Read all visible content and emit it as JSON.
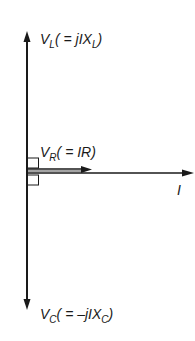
{
  "diagram": {
    "type": "phasor-diagram",
    "phasors": [
      {
        "id": "VL",
        "symbol": "V",
        "subscript": "L",
        "expr_prefix": "( = jIX",
        "expr_sub": "L",
        "expr_suffix": ")",
        "direction": "up"
      },
      {
        "id": "VR",
        "symbol": "V",
        "subscript": "R",
        "expr_prefix": "( = IR)",
        "expr_sub": "",
        "expr_suffix": "",
        "direction": "right"
      },
      {
        "id": "I",
        "symbol": "I",
        "subscript": "",
        "direction": "right"
      },
      {
        "id": "VC",
        "symbol": "V",
        "subscript": "C",
        "expr_prefix": "( = –jIX",
        "expr_sub": "C",
        "expr_suffix": ")",
        "direction": "down"
      }
    ],
    "colors": {
      "line": "#1a1a1a",
      "background": "#ffffff"
    }
  }
}
